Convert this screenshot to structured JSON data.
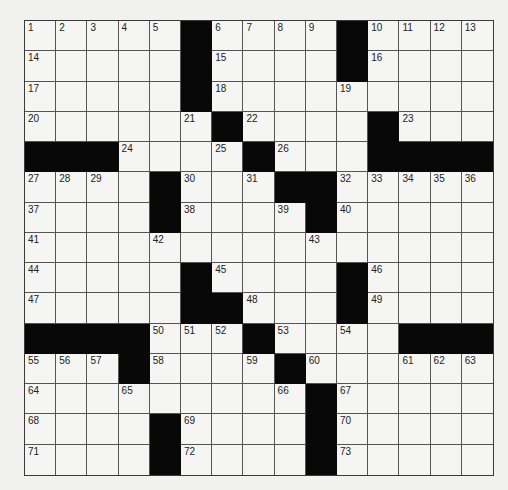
{
  "puzzle": {
    "rows": 15,
    "cols": 15,
    "grid": [
      [
        "1",
        "2",
        "3",
        "4",
        "5",
        "#",
        "6",
        "7",
        "8",
        "9",
        "#",
        "10",
        "11",
        "12",
        "13"
      ],
      [
        "14",
        ".",
        ".",
        ".",
        ".",
        "#",
        "15",
        ".",
        ".",
        ".",
        "#",
        "16",
        ".",
        ".",
        "."
      ],
      [
        "17",
        ".",
        ".",
        ".",
        ".",
        "#",
        "18",
        ".",
        ".",
        ".",
        "19",
        ".",
        ".",
        ".",
        "."
      ],
      [
        "20",
        ".",
        ".",
        ".",
        ".",
        "21",
        "#",
        "22",
        ".",
        ".",
        ".",
        "#",
        "23",
        ".",
        "."
      ],
      [
        "#",
        "#",
        "#",
        "24",
        ".",
        ".",
        "25",
        "#",
        "26",
        ".",
        ".",
        "#",
        "#",
        "#",
        "#"
      ],
      [
        "27",
        "28",
        "29",
        ".",
        "#",
        "30",
        ".",
        "31",
        "#",
        "#",
        "32",
        "33",
        "34",
        "35",
        "36"
      ],
      [
        "37",
        ".",
        ".",
        ".",
        "#",
        "38",
        ".",
        ".",
        "39",
        "#",
        "40",
        ".",
        ".",
        ".",
        "."
      ],
      [
        "41",
        ".",
        ".",
        ".",
        "42",
        ".",
        ".",
        ".",
        ".",
        "43",
        ".",
        ".",
        ".",
        ".",
        "."
      ],
      [
        "44",
        ".",
        ".",
        ".",
        ".",
        "#",
        "45",
        ".",
        ".",
        ".",
        "#",
        "46",
        ".",
        ".",
        "."
      ],
      [
        "47",
        ".",
        ".",
        ".",
        ".",
        "#",
        "#",
        "48",
        ".",
        ".",
        "#",
        "49",
        ".",
        ".",
        "."
      ],
      [
        "#",
        "#",
        "#",
        "#",
        "50",
        "51",
        "52",
        "#",
        "53",
        ".",
        "54",
        ".",
        "#",
        "#",
        "#"
      ],
      [
        "55",
        "56",
        "57",
        "#",
        "58",
        ".",
        ".",
        "59",
        "#",
        "60",
        ".",
        ".",
        "61",
        "62",
        "63"
      ],
      [
        "64",
        ".",
        ".",
        "65",
        ".",
        ".",
        ".",
        ".",
        "66",
        "#",
        "67",
        ".",
        ".",
        ".",
        "."
      ],
      [
        "68",
        ".",
        ".",
        ".",
        "#",
        "69",
        ".",
        ".",
        ".",
        "#",
        "70",
        ".",
        ".",
        ".",
        "."
      ],
      [
        "71",
        ".",
        ".",
        ".",
        "#",
        "72",
        ".",
        ".",
        ".",
        "#",
        "73",
        ".",
        ".",
        ".",
        "."
      ]
    ],
    "legend": {
      "block": "#",
      "empty": "."
    },
    "colors": {
      "background": "#f1f1ef",
      "cell": "#f5f5f3",
      "block": "#080808",
      "grid_line": "#555555",
      "number": "#222222"
    }
  }
}
